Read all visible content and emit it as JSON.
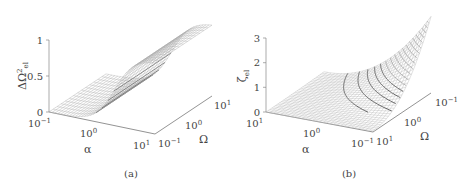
{
  "chart_data": [
    {
      "type": "surface3d",
      "panel_label": "(a)",
      "zlabel": "ΔΩ²_el",
      "xlabel": "α",
      "ylabel": "Ω",
      "z_ticks": [
        "0",
        "0.5",
        "1"
      ],
      "zlim": [
        0,
        1
      ],
      "alpha_ticks": [
        "10⁻¹",
        "10⁰",
        "10¹"
      ],
      "omega_ticks": [
        "10⁻¹",
        "10⁰",
        "10¹"
      ],
      "alpha_range": [
        0.1,
        10
      ],
      "omega_range": [
        0.1,
        10
      ],
      "description": "Sigmoidal step surface: ΔΩ²_el ≈ 0 at low α, rising to ≈ 1 at high α; nearly independent of Ω",
      "profile_vs_log_alpha": {
        "log_alpha": [
          -1,
          -0.5,
          0,
          0.25,
          0.5,
          0.75,
          1
        ],
        "z": [
          0.0,
          0.03,
          0.25,
          0.55,
          0.85,
          0.97,
          1.0
        ]
      }
    },
    {
      "type": "surface3d",
      "panel_label": "(b)",
      "zlabel": "ζ_el",
      "xlabel": "α",
      "ylabel": "Ω",
      "z_ticks": [
        "0",
        "1",
        "2",
        "3"
      ],
      "zlim": [
        0,
        3
      ],
      "alpha_ticks": [
        "10¹",
        "10⁰",
        "10⁻¹"
      ],
      "omega_ticks": [
        "10¹",
        "10⁰",
        "10⁻¹"
      ],
      "alpha_range": [
        10,
        0.1
      ],
      "omega_range": [
        10,
        0.1
      ],
      "description": "Surface peaking (~3) at low α and low Ω, decaying to ≈ 0 at high α and high Ω; highlighted contour lines show constant-ζ levels",
      "corner_values": {
        "alpha_low_omega_low": 3.0,
        "alpha_low_omega_high": 0.1,
        "alpha_high_omega_low": 0.1,
        "alpha_high_omega_high": 0.0
      }
    }
  ],
  "panel_a": {
    "caption": "(a)",
    "zlabel_main": "ΔΩ",
    "zlabel_sup": "2",
    "zlabel_sub": "el",
    "xlabel": "α",
    "ylabel": "Ω",
    "z_ticks": [
      "1",
      "0.5",
      "0"
    ],
    "alpha_tick_1": "10",
    "alpha_tick_1_exp": "−1",
    "alpha_tick_2": "10",
    "alpha_tick_2_exp": "0",
    "alpha_tick_3": "10",
    "alpha_tick_3_exp": "1",
    "omega_tick_1": "10",
    "omega_tick_1_exp": "−1",
    "omega_tick_2": "10",
    "omega_tick_2_exp": "0",
    "omega_tick_3": "10",
    "omega_tick_3_exp": "1"
  },
  "panel_b": {
    "caption": "(b)",
    "zlabel_main": "ζ",
    "zlabel_sub": "el",
    "xlabel": "α",
    "ylabel": "Ω",
    "z_ticks": [
      "3",
      "2",
      "1",
      "0"
    ],
    "alpha_tick_1": "10",
    "alpha_tick_1_exp": "1",
    "alpha_tick_2": "10",
    "alpha_tick_2_exp": "0",
    "alpha_tick_3": "10",
    "alpha_tick_3_exp": "−1",
    "omega_tick_1": "10",
    "omega_tick_1_exp": "1",
    "omega_tick_2": "10",
    "omega_tick_2_exp": "0",
    "omega_tick_3": "10",
    "omega_tick_3_exp": "−1"
  }
}
